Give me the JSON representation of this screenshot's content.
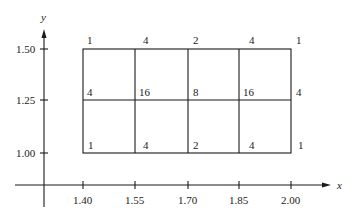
{
  "axes": {
    "x_label": "x",
    "y_label": "y",
    "x_ticks": [
      "1.40",
      "1.55",
      "1.70",
      "1.85",
      "2.00"
    ],
    "y_ticks": [
      "1.50",
      "1.25",
      "1.00"
    ]
  },
  "grid": {
    "x_values": [
      1.4,
      1.55,
      1.7,
      1.85,
      2.0
    ],
    "y_values": [
      1.5,
      1.25,
      1.0
    ],
    "weights": {
      "row_1_50": [
        "1",
        "4",
        "2",
        "4",
        "1"
      ],
      "row_1_25": [
        "4",
        "16",
        "8",
        "16",
        "4"
      ],
      "row_1_00": [
        "1",
        "4",
        "2",
        "4",
        "1"
      ]
    }
  }
}
